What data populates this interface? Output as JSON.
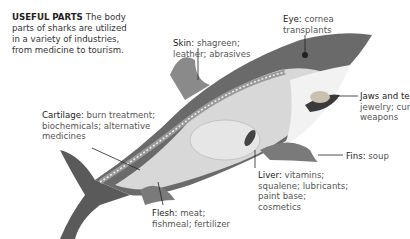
{
  "intro": {
    "heading": "USEFUL PARTS",
    "text": "The body parts of sharks are utilized in a variety of industries, from medicine to tourism."
  },
  "labels": {
    "eye": {
      "title": "Eye:",
      "line1": "cornea",
      "line2": "transplants"
    },
    "skin": {
      "title": "Skin:",
      "line1": "shagreen;",
      "line2": "leather; abrasives"
    },
    "jaws": {
      "title": "Jaws and te",
      "line1": "jewelry; cur",
      "line2": "weapons"
    },
    "cartilage": {
      "title": "Cartilage:",
      "line1": "burn treatment;",
      "line2": "biochemicals; alternative",
      "line3": "medicines"
    },
    "fins": {
      "title": "Fins:",
      "line1": "soup"
    },
    "liver": {
      "title": "Liver:",
      "line1": "vitamins;",
      "line2": "squalene; lubricants;",
      "line3": "paint base;",
      "line4": "cosmetics"
    },
    "flesh": {
      "title": "Flesh:",
      "line1": "meat;",
      "line2": "fishmeal; fertilizer"
    }
  },
  "colors": {
    "shark_dark": "#5a5a5a",
    "shark_mid": "#9a9a9a",
    "shark_light": "#d8d8d8",
    "belly": "#f2f2f2",
    "text": "#333333"
  }
}
